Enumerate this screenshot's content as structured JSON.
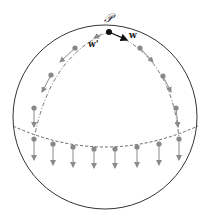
{
  "labels": {
    "point": "𝒫",
    "w": "w",
    "w_prime": "w'"
  },
  "colors": {
    "sphere_outline": "#333333",
    "point_p": "#111111",
    "arrow_w": "#111111",
    "transported_points": "#888888",
    "transported_arrows": "#8a8a8a",
    "dashed_paths": "#666666"
  },
  "diagram": {
    "sphere": {
      "cx": 105,
      "cy": 117,
      "r": 92
    },
    "start_point": {
      "x": 109,
      "y": 32
    },
    "left_arc_points": [
      [
        75,
        48
      ],
      [
        51,
        75
      ],
      [
        34,
        108
      ]
    ],
    "right_arc_points": [
      [
        140,
        48
      ],
      [
        163,
        76
      ],
      [
        176,
        108
      ]
    ],
    "equator_points": [
      [
        34,
        139
      ],
      [
        53,
        144
      ],
      [
        73,
        147
      ],
      [
        94,
        149
      ],
      [
        115,
        149
      ],
      [
        137,
        147
      ],
      [
        159,
        144
      ],
      [
        179,
        139
      ]
    ]
  }
}
